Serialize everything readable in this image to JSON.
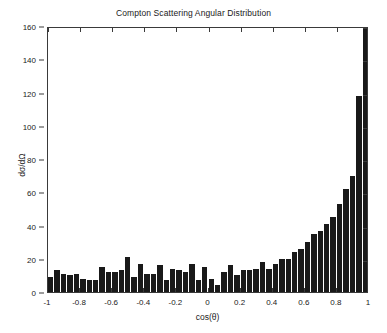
{
  "chart_data": {
    "type": "bar",
    "title": "Compton Scattering Angular Distribution",
    "xlabel": "cos(θ)",
    "ylabel": "dσ/dΩ",
    "xlim": [
      -1,
      1
    ],
    "ylim": [
      0,
      160
    ],
    "xticks": [
      -1,
      -0.8,
      -0.6,
      -0.4,
      -0.2,
      0,
      0.2,
      0.4,
      0.6,
      0.8,
      1
    ],
    "xtick_labels": [
      "-1",
      "-0.8",
      "-0.6",
      "-0.4",
      "-0.2",
      "0",
      "0.2",
      "0.4",
      "0.6",
      "0.8",
      "1"
    ],
    "yticks": [
      0,
      20,
      40,
      60,
      80,
      100,
      120,
      140,
      160
    ],
    "ytick_labels": [
      "0",
      "20",
      "40",
      "60",
      "80",
      "100",
      "120",
      "140",
      "160"
    ],
    "grid": false,
    "legend": null,
    "bar_color": "#191919",
    "n_bins": 50,
    "bin_width": 0.04,
    "bin_centers": [
      -0.98,
      -0.94,
      -0.9,
      -0.86,
      -0.82,
      -0.78,
      -0.74,
      -0.7,
      -0.66,
      -0.62,
      -0.58,
      -0.54,
      -0.5,
      -0.46,
      -0.42,
      -0.38,
      -0.34,
      -0.3,
      -0.26,
      -0.22,
      -0.18,
      -0.14,
      -0.1,
      -0.06,
      -0.02,
      0.02,
      0.06,
      0.1,
      0.14,
      0.18,
      0.22,
      0.26,
      0.3,
      0.34,
      0.38,
      0.42,
      0.46,
      0.5,
      0.54,
      0.58,
      0.62,
      0.66,
      0.7,
      0.74,
      0.78,
      0.82,
      0.86,
      0.9,
      0.94,
      0.98
    ],
    "values": [
      9,
      13,
      11,
      10,
      11,
      8,
      7,
      7,
      15,
      12,
      12,
      13,
      21,
      9,
      17,
      11,
      11,
      16,
      7,
      14,
      13,
      12,
      17,
      7,
      15,
      8,
      4,
      12,
      16,
      10,
      13,
      13,
      14,
      18,
      14,
      17,
      20,
      20,
      24,
      26,
      30,
      35,
      37,
      41,
      45,
      53,
      62,
      70,
      118,
      160
    ]
  }
}
